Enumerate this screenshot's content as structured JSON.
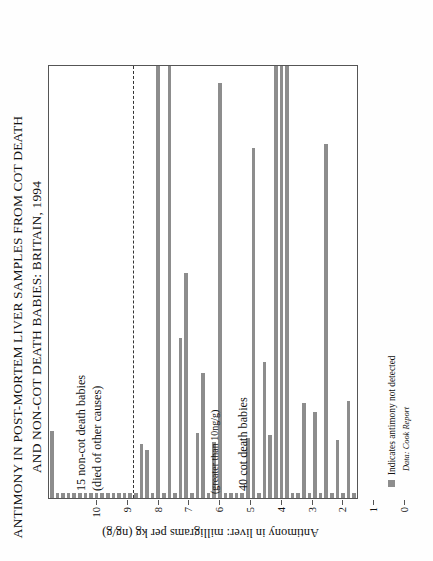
{
  "figure": {
    "title_lines": [
      "ANTIMONY IN POST-MORTEM LIVER SAMPLES FROM COT DEATH",
      "AND NON-COT DEATH BABIES: BRITAIN, 1994"
    ],
    "annotation": "(greater than 10ng/g)",
    "legend_label": "Indicates antimony not detected",
    "source": "Data: Cook Report",
    "bar_color": "#8d8d8d",
    "axis_color": "#555555",
    "group_labels": {
      "cot": "40 cot death babies",
      "noncot_line1": "15 non-cot death babies",
      "noncot_line2": "(died of other causes)"
    }
  },
  "chart_data": {
    "type": "bar",
    "orientation": "horizontal-rotated",
    "title": "ANTIMONY IN POST-MORTEM LIVER SAMPLES FROM COT DEATH AND NON-COT DEATH BABIES: BRITAIN, 1994",
    "xlabel": "",
    "ylabel": "Antimony in liver: milligrams per kg (ng/g)",
    "ylim": [
      0,
      10
    ],
    "yticks": [
      10,
      9,
      8,
      7,
      6,
      5,
      4,
      3,
      2,
      1,
      0
    ],
    "grid": false,
    "legend_position": "bottom-left",
    "not_detected_value": 0.12,
    "annotations": [
      {
        "text": "(greater than 10ng/g)",
        "note": "marks bars that reach the 10 ng/g ceiling"
      }
    ],
    "groups": [
      {
        "name": "40 cot death babies",
        "count": 40,
        "values": [
          0.12,
          2.25,
          0.12,
          1.35,
          0.12,
          8.2,
          0.12,
          2.0,
          0.12,
          2.2,
          0.12,
          0.12,
          10.0,
          10.0,
          10.0,
          1.45,
          3.15,
          0.12,
          8.1,
          1.4,
          0.12,
          0.12,
          0.12,
          0.12,
          9.6,
          1.3,
          0.12,
          2.9,
          1.5,
          0.12,
          5.2,
          3.7,
          0.12,
          10.0,
          0.12,
          10.0,
          0.12,
          1.1,
          1.25,
          0.12
        ]
      },
      {
        "name": "15 non-cot death babies (died of other causes)",
        "count": 15,
        "values": [
          0.12,
          0.12,
          0.12,
          0.12,
          0.12,
          0.12,
          0.12,
          0.12,
          0.12,
          0.12,
          0.12,
          0.12,
          0.12,
          0.12,
          1.55
        ]
      }
    ]
  }
}
